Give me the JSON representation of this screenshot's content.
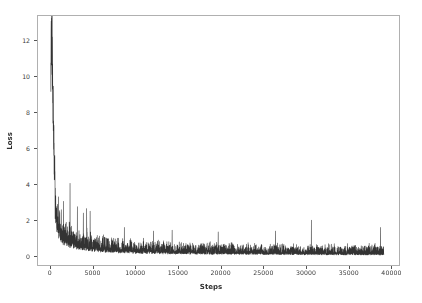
{
  "figure": {
    "background_color": "#ffffff",
    "axes_background_color": "#ffffff",
    "spine_color": "#b0b0b0",
    "tick_color": "#555555",
    "text_color": "#3b3b3b"
  },
  "chart_data": {
    "type": "line",
    "title": "",
    "subtitle": "",
    "xlabel": "Steps",
    "ylabel": "Loss",
    "line_color": "#333333",
    "line_width": 0.6,
    "grid": false,
    "legend": null,
    "annotations": [],
    "xlim": [
      -1500,
      41000
    ],
    "ylim": [
      -0.55,
      13.4
    ],
    "xticks": [
      0,
      5000,
      10000,
      15000,
      20000,
      25000,
      30000,
      35000,
      40000
    ],
    "xticklabels": [
      "0",
      "5000",
      "10000",
      "15000",
      "20000",
      "25000",
      "30000",
      "35000",
      "40000"
    ],
    "yticks": [
      0,
      2,
      4,
      6,
      8,
      10,
      12
    ],
    "yticklabels": [
      "0",
      "2",
      "4",
      "6",
      "8",
      "10",
      "12"
    ],
    "series": [
      {
        "name": "Training loss",
        "x_start": 0,
        "x_end": 39000,
        "n_points": 3900,
        "peak_value": 12.9,
        "peak_step": 60,
        "final_value": 0.18,
        "description": "Training loss per step: sharp spike to ~12.9 at start, rapid decay below 1.0 by ~3000 steps, then a noisy band settling near 0.15-0.4 with intermittent spikes up to ~2.1",
        "envelope_points": [
          {
            "step": 0,
            "mean": 11.2,
            "spread": 1.8
          },
          {
            "step": 60,
            "mean": 12.9,
            "spread": 1.2
          },
          {
            "step": 150,
            "mean": 11.8,
            "spread": 1.4
          },
          {
            "step": 260,
            "mean": 8.6,
            "spread": 1.0
          },
          {
            "step": 400,
            "mean": 5.2,
            "spread": 0.9
          },
          {
            "step": 600,
            "mean": 3.3,
            "spread": 0.8
          },
          {
            "step": 900,
            "mean": 2.2,
            "spread": 0.9
          },
          {
            "step": 1400,
            "mean": 1.55,
            "spread": 0.85
          },
          {
            "step": 2000,
            "mean": 1.25,
            "spread": 0.9
          },
          {
            "step": 2600,
            "mean": 1.05,
            "spread": 0.85
          },
          {
            "step": 3400,
            "mean": 0.88,
            "spread": 0.8
          },
          {
            "step": 4500,
            "mean": 0.72,
            "spread": 0.75
          },
          {
            "step": 6000,
            "mean": 0.58,
            "spread": 0.6
          },
          {
            "step": 8000,
            "mean": 0.5,
            "spread": 0.55
          },
          {
            "step": 10000,
            "mean": 0.43,
            "spread": 0.5
          },
          {
            "step": 13000,
            "mean": 0.38,
            "spread": 0.48
          },
          {
            "step": 16000,
            "mean": 0.35,
            "spread": 0.45
          },
          {
            "step": 20000,
            "mean": 0.32,
            "spread": 0.45
          },
          {
            "step": 24000,
            "mean": 0.3,
            "spread": 0.42
          },
          {
            "step": 28000,
            "mean": 0.28,
            "spread": 0.42
          },
          {
            "step": 32000,
            "mean": 0.26,
            "spread": 0.4
          },
          {
            "step": 36000,
            "mean": 0.25,
            "spread": 0.42
          },
          {
            "step": 39000,
            "mean": 0.24,
            "spread": 0.45
          }
        ],
        "notable_spikes": [
          {
            "step": 2250,
            "value": 4.1
          },
          {
            "step": 900,
            "value": 3.35
          },
          {
            "step": 1500,
            "value": 3.1
          },
          {
            "step": 3100,
            "value": 2.8
          },
          {
            "step": 4200,
            "value": 2.7
          },
          {
            "step": 4600,
            "value": 2.55
          },
          {
            "step": 3800,
            "value": 2.45
          },
          {
            "step": 8600,
            "value": 1.65
          },
          {
            "step": 12000,
            "value": 1.45
          },
          {
            "step": 14200,
            "value": 1.5
          },
          {
            "step": 19600,
            "value": 1.4
          },
          {
            "step": 26300,
            "value": 1.45
          },
          {
            "step": 30500,
            "value": 2.05
          },
          {
            "step": 38600,
            "value": 1.65
          }
        ]
      }
    ]
  }
}
